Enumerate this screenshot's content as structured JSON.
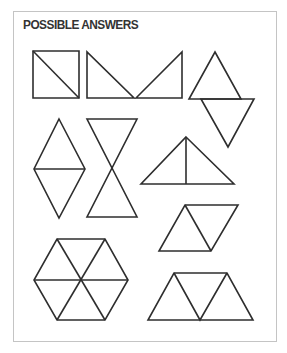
{
  "title": "POSSIBLE ANSWERS",
  "colors": {
    "stroke": "#2e2e2e",
    "frame_border": "#c4c4c4",
    "title": "#333333",
    "background": "#ffffff"
  },
  "figures": [
    {
      "name": "square-split-diagonal",
      "description": "Square divided by one diagonal into two right triangles"
    },
    {
      "name": "two-right-triangles-v",
      "description": "Two right triangles arranged base-to-base forming a V"
    },
    {
      "name": "two-triangles-offset",
      "description": "Upward and downward equilateral triangles offset"
    },
    {
      "name": "rhombus-split",
      "description": "Two equilateral triangles base-to-base forming a rhombus"
    },
    {
      "name": "hourglass",
      "description": "Two triangles tip-to-tip forming an hourglass"
    },
    {
      "name": "isosceles-split",
      "description": "Triangle divided by a vertical altitude into two right triangles"
    },
    {
      "name": "parallelogram",
      "description": "Two equilateral triangles forming a parallelogram"
    },
    {
      "name": "hexagon",
      "description": "Regular hexagon divided into six equilateral triangles"
    },
    {
      "name": "trapezoid",
      "description": "Three equilateral triangles forming a trapezoid"
    }
  ]
}
